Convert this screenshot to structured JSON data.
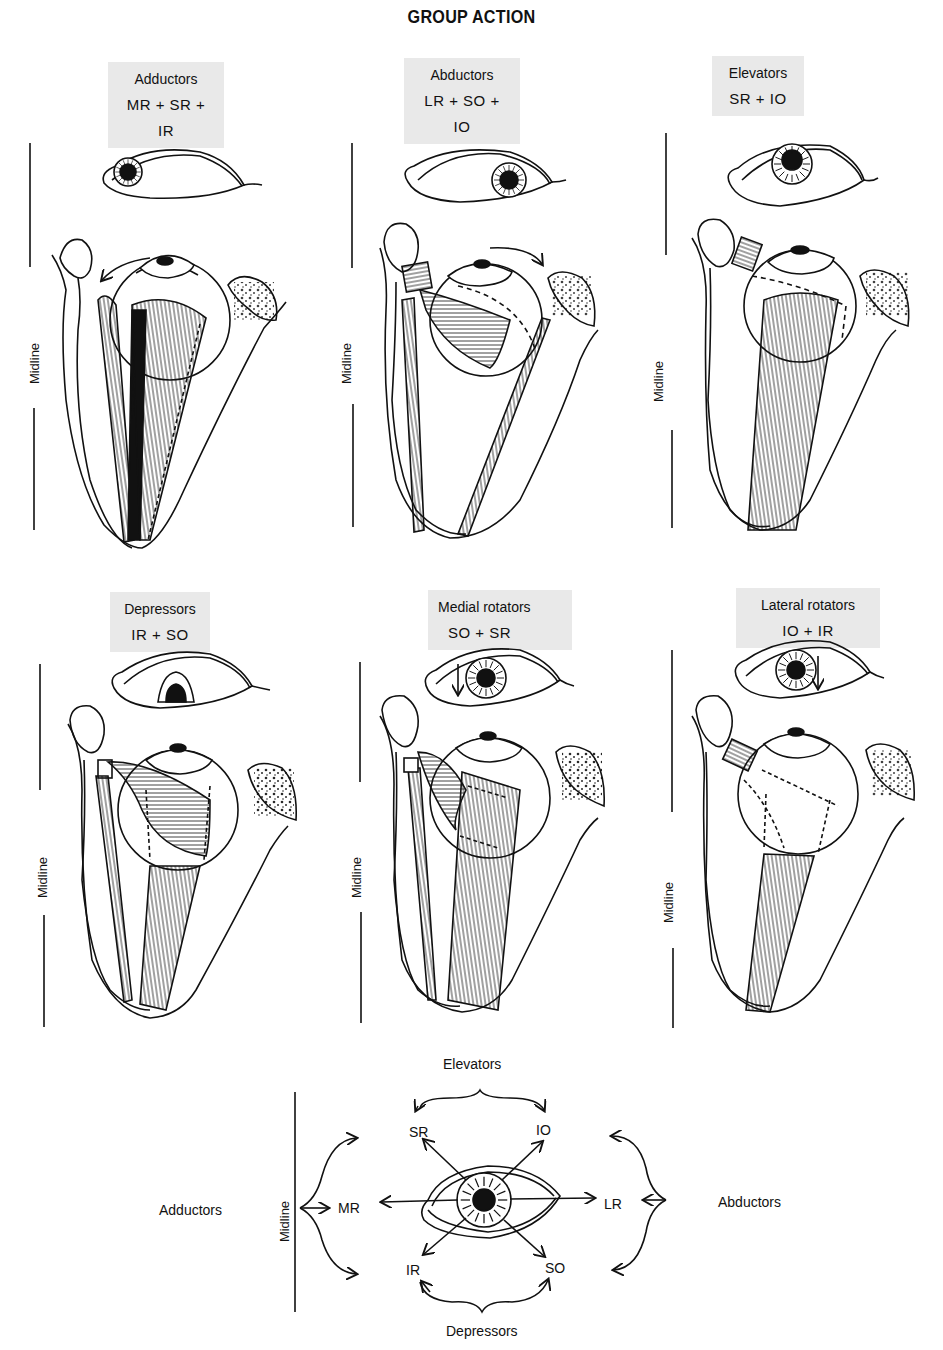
{
  "title": "GROUP ACTION",
  "midline_label": "Midline",
  "panels": [
    {
      "name": "adductors",
      "label": "Adductors",
      "muscles": "MR + SR + IR",
      "gaze": "medial"
    },
    {
      "name": "abductors",
      "label": "Abductors",
      "muscles": "LR + SO + IO",
      "gaze": "lateral"
    },
    {
      "name": "elevators",
      "label": "Elevators",
      "muscles": "SR + IO",
      "gaze": "up"
    },
    {
      "name": "depressors",
      "label": "Depressors",
      "muscles": "IR + SO",
      "gaze": "down"
    },
    {
      "name": "medial-rotators",
      "label": "Medial rotators",
      "muscles": "SO + SR",
      "gaze": "intorsion"
    },
    {
      "name": "lateral-rotators",
      "label": "Lateral rotators",
      "muscles": "IO + IR",
      "gaze": "extorsion"
    }
  ],
  "summary_diagram": {
    "top_group": "Elevators",
    "bottom_group": "Depressors",
    "left_group": "Adductors",
    "right_group": "Abductors",
    "midline": "Midline",
    "muscles": {
      "upper_left": "SR",
      "upper_right": "IO",
      "left": "MR",
      "right": "LR",
      "lower_left": "IR",
      "lower_right": "SO"
    }
  },
  "colors": {
    "ink": "#111111",
    "label_card": "#e9e9e9",
    "background": "#ffffff"
  }
}
